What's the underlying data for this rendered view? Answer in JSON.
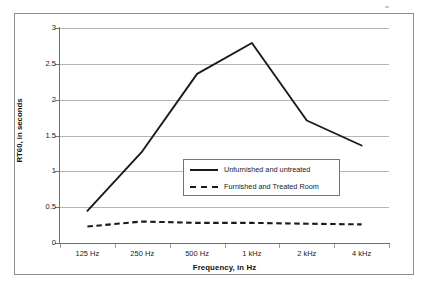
{
  "chart_data": {
    "type": "line",
    "title": "",
    "xlabel": "Frequency, in Hz",
    "ylabel": "RT60, in seconds",
    "categories": [
      "125 Hz",
      "250 Hz",
      "500 Hz",
      "1 kHz",
      "2 kHz",
      "4 kHz"
    ],
    "ylim": [
      0,
      3
    ],
    "yticks": [
      0,
      0.5,
      1,
      1.5,
      2,
      2.5,
      3
    ],
    "ytick_labels": [
      "0",
      "0.5",
      "1",
      "1.5",
      "2",
      "2.5",
      "3"
    ],
    "grid": true,
    "legend_position": "center",
    "series": [
      {
        "name": "Unfurnished and untreated",
        "style": "solid",
        "color": "#1a1a1a",
        "values": [
          0.45,
          1.28,
          2.36,
          2.79,
          1.71,
          1.36
        ]
      },
      {
        "name": "Furnished and Treated Room",
        "style": "dashed",
        "color": "#1a1a1a",
        "values": [
          0.23,
          0.3,
          0.28,
          0.28,
          0.27,
          0.26
        ]
      }
    ]
  },
  "legend": {
    "entries": [
      {
        "label": "Unfurnished and untreated"
      },
      {
        "label": "Furnished and Treated Room"
      }
    ]
  },
  "axes": {
    "x_title": "Frequency, in Hz",
    "y_title": "RT60, in seconds"
  }
}
